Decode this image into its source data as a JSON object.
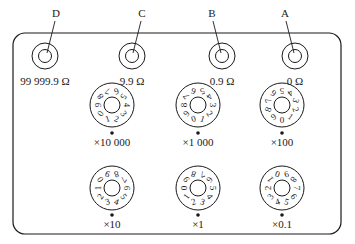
{
  "diagram": {
    "terminals": [
      {
        "letter": "D",
        "value": "99 999.9 Ω",
        "cx": 45,
        "cy": 56
      },
      {
        "letter": "C",
        "value": "9.9 Ω",
        "cx": 132,
        "cy": 56
      },
      {
        "letter": "B",
        "value": "0.9 Ω",
        "cx": 222,
        "cy": 56
      },
      {
        "letter": "A",
        "value": "0 Ω",
        "cx": 295,
        "cy": 56
      }
    ],
    "dials": [
      {
        "multiplier": "×10 000",
        "cx": 112,
        "cy": 110
      },
      {
        "multiplier": "×1 000",
        "cx": 198,
        "cy": 110
      },
      {
        "multiplier": "×100",
        "cx": 282,
        "cy": 110
      },
      {
        "multiplier": "×10",
        "cx": 112,
        "cy": 193
      },
      {
        "multiplier": "×1",
        "cx": 198,
        "cy": 193
      },
      {
        "multiplier": "×0.1",
        "cx": 282,
        "cy": 193
      }
    ],
    "dial_digits": [
      "0",
      "1",
      "2",
      "3",
      "4",
      "5",
      "6",
      "7",
      "8",
      "9"
    ],
    "colors": {
      "stroke": "#1a1a1a",
      "background": "#ffffff"
    }
  }
}
